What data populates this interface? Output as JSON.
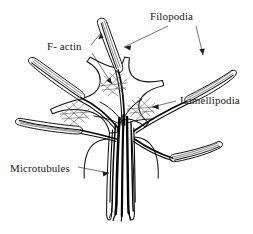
{
  "figure": {
    "background_color": "#fefefe",
    "ink_color": "#111111",
    "width": 253,
    "height": 234
  },
  "labels": [
    {
      "id": "filopodia",
      "text": "Filopodia",
      "x": 150,
      "y": 20,
      "anchor": "start",
      "leaders": [
        {
          "from": [
            168,
            26
          ],
          "to": [
            124,
            47
          ],
          "arrow_angle": 205
        },
        {
          "from": [
            196,
            26
          ],
          "to": [
            203,
            55
          ],
          "arrow_angle": 77
        }
      ]
    },
    {
      "id": "f-actin",
      "text": "F- actin",
      "x": 47,
      "y": 50,
      "anchor": "start",
      "leaders": [
        {
          "from": [
            91,
            45
          ],
          "to": [
            101,
            33
          ],
          "arrow_angle": 310
        },
        {
          "from": [
            92,
            53
          ],
          "to": [
            112,
            84
          ],
          "arrow_angle": 57
        }
      ]
    },
    {
      "id": "lamellipodia",
      "text": "Lamellipodia",
      "x": 180,
      "y": 104,
      "anchor": "start",
      "leaders": [
        {
          "from": [
            176,
            101
          ],
          "to": [
            152,
            107
          ],
          "arrow_angle": 194
        }
      ]
    },
    {
      "id": "microtubules",
      "text": "Microtubules",
      "x": 10,
      "y": 172,
      "anchor": "start",
      "leaders": [
        {
          "from": [
            78,
            167
          ],
          "to": [
            109,
            173
          ],
          "arrow_angle": 11
        }
      ]
    }
  ],
  "structures": {
    "filopodia_count": 5,
    "filopodia_names": [
      "filopodium-top",
      "filopodium-upper-left",
      "filopodium-left",
      "filopodium-upper-right",
      "filopodium-lower-right"
    ],
    "lamellipodia_count": 4,
    "axon_shaft": "axon-shaft",
    "microtubule_bundle": "microtubule-bundle",
    "actin_mesh_regions": 3
  }
}
